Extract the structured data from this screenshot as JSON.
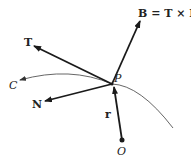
{
  "diagram": {
    "labels": {
      "binormal": "B = T × N",
      "tangent": "T",
      "normal": "N",
      "curve": "C",
      "point": "P",
      "position_vector": "r",
      "origin": "O"
    },
    "colors": {
      "vector": "#1a1a1a",
      "curve": "#555555",
      "background": "#ffffff"
    }
  }
}
